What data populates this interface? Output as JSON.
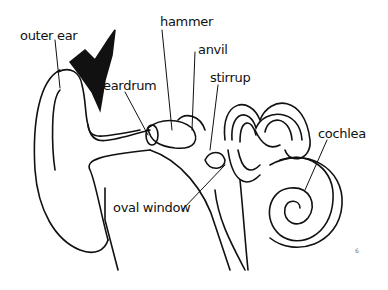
{
  "diagram": {
    "labels": {
      "outer_ear": "outer ear",
      "hammer": "hammer",
      "anvil": "anvil",
      "eardrum": "eardrum",
      "stirrup": "stirrup",
      "cochlea": "cochlea",
      "oval_window": "oval window"
    },
    "page_number": "6"
  }
}
